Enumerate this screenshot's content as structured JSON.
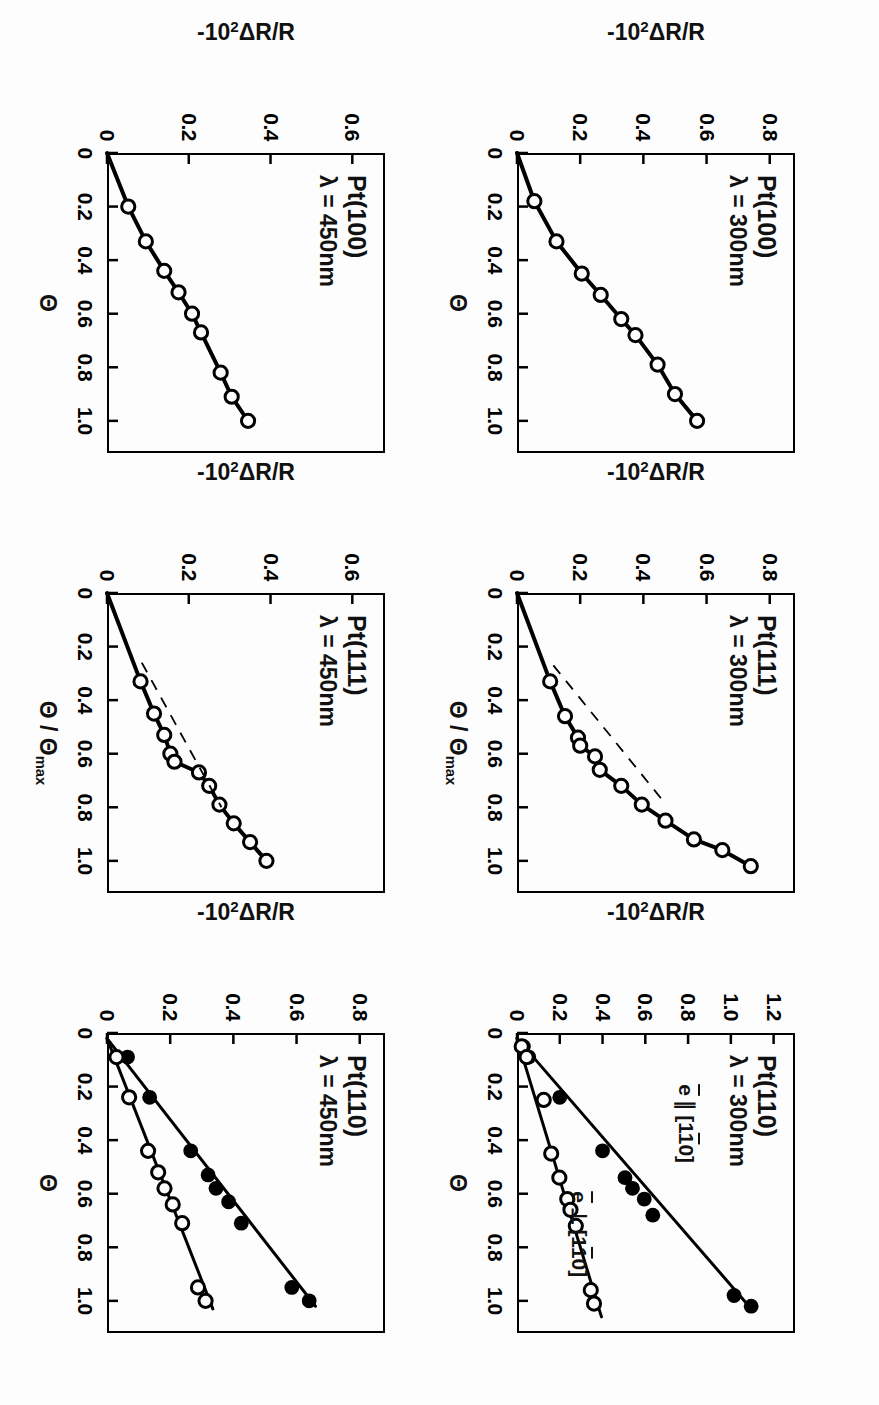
{
  "figure": {
    "type": "multi-panel-scatter-line",
    "rows": 2,
    "cols": 3,
    "rotation_deg": 90,
    "background": "#fdfdfd",
    "ink": "#000000"
  },
  "axis_titles": {
    "y": "-10²ΔR/R",
    "y_prefix": "-10",
    "y_exp": "2",
    "y_suffix": "ΔR/R",
    "x_theta": "Θ",
    "x_theta_ratio_num": "Θ",
    "x_theta_ratio_den": "Θ",
    "x_theta_ratio_sub": "max",
    "x_theta_ratio": "Θ / Θmax"
  },
  "legend_labels": {
    "parallel": "ē ∥ [1́0]",
    "parallel_plain": "e ∥ [110]",
    "perpendicular": "ē ⊥ [1́0]",
    "perpendicular_plain": "e ⊥ [110]",
    "e_symbol": "e",
    "parallel_symbol": "∥",
    "perp_symbol": "⊥",
    "bracket_open": "[1",
    "bracket_index": "1",
    "bracket_close": "0]"
  },
  "chart_data": [
    {
      "id": "pt100-300",
      "type": "scatter",
      "panel_row": 0,
      "panel_col": 0,
      "title": "Pt(100)",
      "subtitle": "λ = 300nm",
      "surface": "Pt(100)",
      "wavelength_nm": 300,
      "xlabel": "Θ",
      "ylabel": "-10²ΔR/R",
      "xlim": [
        0,
        1.12
      ],
      "ylim": [
        0,
        0.88
      ],
      "xticks": [
        0,
        0.2,
        0.4,
        0.6,
        0.8,
        1.0
      ],
      "xticklabels": [
        "0",
        "0.2",
        "0.4",
        "0.6",
        "0.8",
        "1.0"
      ],
      "yticks": [
        0,
        0.2,
        0.4,
        0.6,
        0.8
      ],
      "yticklabels": [
        "0",
        "0.2",
        "0.4",
        "0.6",
        "0.8"
      ],
      "grid": false,
      "legend": "none",
      "series": [
        {
          "name": "open-circles",
          "marker": "open-circle",
          "line": "solid",
          "points": [
            {
              "x": 0.0,
              "y": 0.0
            },
            {
              "x": 0.18,
              "y": 0.055
            },
            {
              "x": 0.33,
              "y": 0.125
            },
            {
              "x": 0.45,
              "y": 0.205
            },
            {
              "x": 0.53,
              "y": 0.265
            },
            {
              "x": 0.62,
              "y": 0.33
            },
            {
              "x": 0.68,
              "y": 0.375
            },
            {
              "x": 0.79,
              "y": 0.445
            },
            {
              "x": 0.9,
              "y": 0.5
            },
            {
              "x": 1.0,
              "y": 0.57
            }
          ]
        }
      ]
    },
    {
      "id": "pt111-300",
      "type": "scatter",
      "panel_row": 0,
      "panel_col": 1,
      "title": "Pt(111)",
      "subtitle": "λ = 300nm",
      "surface": "Pt(111)",
      "wavelength_nm": 300,
      "xlabel": "Θ / Θmax",
      "ylabel": "-10²ΔR/R",
      "xlim": [
        0,
        1.12
      ],
      "ylim": [
        0,
        0.88
      ],
      "xticks": [
        0,
        0.2,
        0.4,
        0.6,
        0.8,
        1.0
      ],
      "xticklabels": [
        "0",
        "0.2",
        "0.4",
        "0.6",
        "0.8",
        "1.0"
      ],
      "yticks": [
        0,
        0.2,
        0.4,
        0.6,
        0.8
      ],
      "yticklabels": [
        "0",
        "0.2",
        "0.4",
        "0.6",
        "0.8"
      ],
      "grid": false,
      "legend": "none",
      "series": [
        {
          "name": "open-circles",
          "marker": "open-circle",
          "line": "solid",
          "points": [
            {
              "x": 0.0,
              "y": 0.0
            },
            {
              "x": 0.33,
              "y": 0.105
            },
            {
              "x": 0.46,
              "y": 0.152
            },
            {
              "x": 0.54,
              "y": 0.193
            },
            {
              "x": 0.57,
              "y": 0.2
            },
            {
              "x": 0.61,
              "y": 0.247
            },
            {
              "x": 0.66,
              "y": 0.262
            },
            {
              "x": 0.72,
              "y": 0.33
            },
            {
              "x": 0.79,
              "y": 0.395
            },
            {
              "x": 0.85,
              "y": 0.47
            },
            {
              "x": 0.92,
              "y": 0.56
            },
            {
              "x": 0.96,
              "y": 0.65
            },
            {
              "x": 1.02,
              "y": 0.74
            }
          ]
        },
        {
          "name": "dashed-tangent",
          "marker": "none",
          "line": "dashed",
          "points": [
            {
              "x": 0.27,
              "y": 0.115
            },
            {
              "x": 0.78,
              "y": 0.465
            }
          ]
        }
      ]
    },
    {
      "id": "pt110-300",
      "type": "scatter",
      "panel_row": 0,
      "panel_col": 2,
      "title": "Pt(110)",
      "subtitle": "λ = 300nm",
      "surface": "Pt(110)",
      "wavelength_nm": 300,
      "xlabel": "Θ",
      "ylabel": "-10²ΔR/R",
      "xlim": [
        0,
        1.12
      ],
      "ylim": [
        0,
        1.3
      ],
      "xticks": [
        0,
        0.2,
        0.4,
        0.6,
        0.8,
        1.0
      ],
      "xticklabels": [
        "0",
        "0.2",
        "0.4",
        "0.6",
        "0.8",
        "1.0"
      ],
      "yticks": [
        0,
        0.2,
        0.4,
        0.6,
        0.8,
        1.0,
        1.2
      ],
      "yticklabels": [
        "0",
        "0.2",
        "0.4",
        "0.6",
        "0.8",
        "1.0",
        "1.2"
      ],
      "grid": false,
      "legend": "in-plot",
      "annotations": [
        {
          "text": "ē ∥ [1́0]",
          "x": 0.4,
          "y": 0.78
        },
        {
          "text": "ē ⊥ [1́0]",
          "x": 0.8,
          "y": 0.28
        }
      ],
      "series": [
        {
          "name": "e-parallel-[1-10]",
          "marker": "filled-circle",
          "line": "solid",
          "points": [
            {
              "x": 0.05,
              "y": 0.03
            },
            {
              "x": 0.09,
              "y": 0.055
            },
            {
              "x": 0.24,
              "y": 0.2
            },
            {
              "x": 0.44,
              "y": 0.4
            },
            {
              "x": 0.54,
              "y": 0.505
            },
            {
              "x": 0.58,
              "y": 0.54
            },
            {
              "x": 0.62,
              "y": 0.595
            },
            {
              "x": 0.68,
              "y": 0.635
            },
            {
              "x": 0.98,
              "y": 1.015
            },
            {
              "x": 1.02,
              "y": 1.095
            }
          ],
          "fit_line": [
            {
              "x": 0.02,
              "y": 0.0
            },
            {
              "x": 1.02,
              "y": 1.085
            }
          ]
        },
        {
          "name": "e-perpendicular-[1-10]",
          "marker": "open-circle",
          "line": "solid",
          "points": [
            {
              "x": 0.05,
              "y": 0.022
            },
            {
              "x": 0.09,
              "y": 0.045
            },
            {
              "x": 0.25,
              "y": 0.125
            },
            {
              "x": 0.45,
              "y": 0.16
            },
            {
              "x": 0.54,
              "y": 0.198
            },
            {
              "x": 0.62,
              "y": 0.235
            },
            {
              "x": 0.66,
              "y": 0.25
            },
            {
              "x": 0.72,
              "y": 0.275
            },
            {
              "x": 0.96,
              "y": 0.345
            },
            {
              "x": 1.01,
              "y": 0.36
            }
          ],
          "fit_line": [
            {
              "x": 0.02,
              "y": 0.0
            },
            {
              "x": 1.06,
              "y": 0.395
            }
          ]
        }
      ]
    },
    {
      "id": "pt100-450",
      "type": "scatter",
      "panel_row": 1,
      "panel_col": 0,
      "title": "Pt(100)",
      "subtitle": "λ = 450nm",
      "surface": "Pt(100)",
      "wavelength_nm": 450,
      "xlabel": "Θ",
      "ylabel": "-10²ΔR/R",
      "xlim": [
        0,
        1.12
      ],
      "ylim": [
        0,
        0.68
      ],
      "xticks": [
        0,
        0.2,
        0.4,
        0.6,
        0.8,
        1.0
      ],
      "xticklabels": [
        "0",
        "0.2",
        "0.4",
        "0.6",
        "0.8",
        "1.0"
      ],
      "yticks": [
        0,
        0.2,
        0.4,
        0.6
      ],
      "yticklabels": [
        "0",
        "0.2",
        "0.4",
        "0.6"
      ],
      "grid": false,
      "legend": "none",
      "series": [
        {
          "name": "open-circles",
          "marker": "open-circle",
          "line": "solid",
          "points": [
            {
              "x": 0.0,
              "y": 0.0
            },
            {
              "x": 0.2,
              "y": 0.052
            },
            {
              "x": 0.33,
              "y": 0.095
            },
            {
              "x": 0.44,
              "y": 0.14
            },
            {
              "x": 0.52,
              "y": 0.175
            },
            {
              "x": 0.6,
              "y": 0.208
            },
            {
              "x": 0.67,
              "y": 0.23
            },
            {
              "x": 0.82,
              "y": 0.278
            },
            {
              "x": 0.91,
              "y": 0.305
            },
            {
              "x": 1.0,
              "y": 0.345
            }
          ]
        }
      ]
    },
    {
      "id": "pt111-450",
      "type": "scatter",
      "panel_row": 1,
      "panel_col": 1,
      "title": "Pt(111)",
      "subtitle": "λ = 450nm",
      "surface": "Pt(111)",
      "wavelength_nm": 450,
      "xlabel": "Θ / Θmax",
      "ylabel": "-10²ΔR/R",
      "xlim": [
        0,
        1.12
      ],
      "ylim": [
        0,
        0.68
      ],
      "xticks": [
        0,
        0.2,
        0.4,
        0.6,
        0.8,
        1.0
      ],
      "xticklabels": [
        "0",
        "0.2",
        "0.4",
        "0.6",
        "0.8",
        "1.0"
      ],
      "yticks": [
        0,
        0.2,
        0.4,
        0.6
      ],
      "yticklabels": [
        "0",
        "0.2",
        "0.4",
        "0.6"
      ],
      "grid": false,
      "legend": "none",
      "series": [
        {
          "name": "open-circles",
          "marker": "open-circle",
          "line": "solid",
          "points": [
            {
              "x": 0.0,
              "y": 0.0
            },
            {
              "x": 0.33,
              "y": 0.082
            },
            {
              "x": 0.45,
              "y": 0.115
            },
            {
              "x": 0.53,
              "y": 0.14
            },
            {
              "x": 0.6,
              "y": 0.155
            },
            {
              "x": 0.63,
              "y": 0.165
            },
            {
              "x": 0.67,
              "y": 0.225
            },
            {
              "x": 0.72,
              "y": 0.25
            },
            {
              "x": 0.79,
              "y": 0.275
            },
            {
              "x": 0.86,
              "y": 0.31
            },
            {
              "x": 0.93,
              "y": 0.35
            },
            {
              "x": 1.0,
              "y": 0.39
            }
          ]
        },
        {
          "name": "dashed-tangent",
          "marker": "none",
          "line": "dashed",
          "points": [
            {
              "x": 0.26,
              "y": 0.085
            },
            {
              "x": 0.8,
              "y": 0.28
            }
          ]
        }
      ]
    },
    {
      "id": "pt110-450",
      "type": "scatter",
      "panel_row": 1,
      "panel_col": 2,
      "title": "Pt(110)",
      "subtitle": "λ = 450nm",
      "surface": "Pt(110)",
      "wavelength_nm": 450,
      "xlabel": "Θ",
      "ylabel": "-10²ΔR/R",
      "xlim": [
        0,
        1.12
      ],
      "ylim": [
        0,
        0.88
      ],
      "xticks": [
        0,
        0.2,
        0.4,
        0.6,
        0.8,
        1.0
      ],
      "xticklabels": [
        "0",
        "0.2",
        "0.4",
        "0.6",
        "0.8",
        "1.0"
      ],
      "yticks": [
        0,
        0.2,
        0.4,
        0.6,
        0.8
      ],
      "yticklabels": [
        "0",
        "0.2",
        "0.4",
        "0.6",
        "0.8"
      ],
      "grid": false,
      "legend": "none",
      "series": [
        {
          "name": "e-parallel-[1-10]",
          "marker": "filled-circle",
          "line": "solid",
          "points": [
            {
              "x": 0.09,
              "y": 0.065
            },
            {
              "x": 0.24,
              "y": 0.135
            },
            {
              "x": 0.44,
              "y": 0.265
            },
            {
              "x": 0.53,
              "y": 0.32
            },
            {
              "x": 0.58,
              "y": 0.345
            },
            {
              "x": 0.63,
              "y": 0.385
            },
            {
              "x": 0.71,
              "y": 0.425
            },
            {
              "x": 0.95,
              "y": 0.585
            },
            {
              "x": 1.0,
              "y": 0.64
            }
          ],
          "fit_line": [
            {
              "x": 0.02,
              "y": 0.0
            },
            {
              "x": 1.02,
              "y": 0.66
            }
          ]
        },
        {
          "name": "e-perpendicular-[1-10]",
          "marker": "open-circle",
          "line": "solid",
          "points": [
            {
              "x": 0.09,
              "y": 0.03
            },
            {
              "x": 0.24,
              "y": 0.07
            },
            {
              "x": 0.44,
              "y": 0.13
            },
            {
              "x": 0.52,
              "y": 0.162
            },
            {
              "x": 0.58,
              "y": 0.182
            },
            {
              "x": 0.64,
              "y": 0.208
            },
            {
              "x": 0.71,
              "y": 0.238
            },
            {
              "x": 0.95,
              "y": 0.288
            },
            {
              "x": 1.0,
              "y": 0.312
            }
          ],
          "fit_line": [
            {
              "x": 0.02,
              "y": 0.0
            },
            {
              "x": 1.03,
              "y": 0.335
            }
          ]
        }
      ]
    }
  ]
}
